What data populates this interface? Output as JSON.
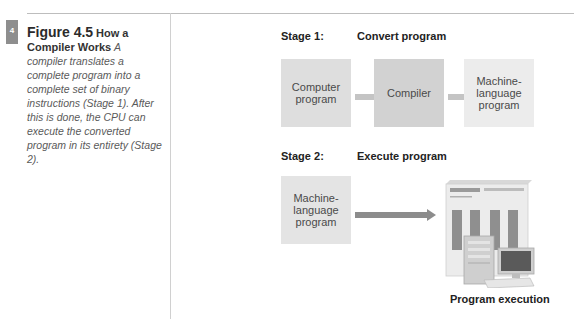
{
  "page": {
    "tab_number": "4"
  },
  "caption": {
    "figure_number": "Figure 4.5",
    "title": "How a Compiler Works",
    "text": "A compiler translates a complete program into a complete set of binary instructions (Stage 1). After this is done, the CPU can execute the converted program in its entirety (Stage 2)."
  },
  "diagram": {
    "stage1": {
      "label": "Stage 1:",
      "title": "Convert program",
      "boxes": [
        {
          "label": "Computer\nprogram",
          "color": "#dedede"
        },
        {
          "label": "Compiler",
          "color": "#d2d2d2"
        },
        {
          "label": "Machine-\nlanguage\nprogram",
          "color": "#ececec"
        }
      ],
      "arrow_color": "#c4c4c4"
    },
    "stage2": {
      "label": "Stage 2:",
      "title": "Execute program",
      "box": {
        "label": "Machine-\nlanguage\nprogram",
        "color": "#e4e4e4"
      },
      "arrow_color": "#8c8c8c",
      "target_icon": "computer-system-icon",
      "target_label": "Program execution"
    }
  }
}
